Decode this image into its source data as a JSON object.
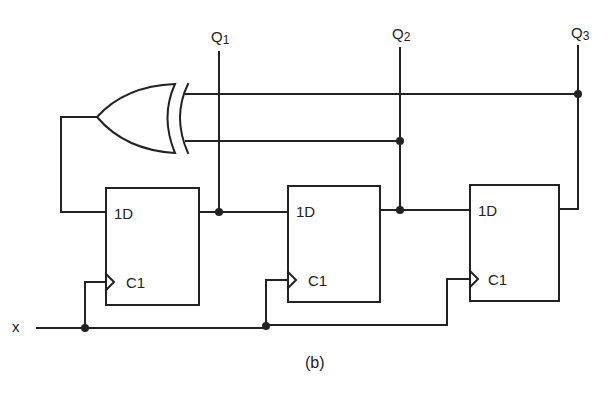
{
  "diagram": {
    "type": "shift-register-with-xor-feedback",
    "caption": "(b)",
    "input_label": "x",
    "outputs": [
      {
        "label_main": "Q",
        "label_sub": "1"
      },
      {
        "label_main": "Q",
        "label_sub": "2"
      },
      {
        "label_main": "Q",
        "label_sub": "3"
      }
    ],
    "flipflops": [
      {
        "d_label": "1D",
        "clk_label": "C1"
      },
      {
        "d_label": "1D",
        "clk_label": "C1"
      },
      {
        "d_label": "1D",
        "clk_label": "C1"
      }
    ],
    "gate": {
      "type": "XOR",
      "inputs": [
        "Q2",
        "Q3"
      ],
      "output": "FF1.1D"
    },
    "colors": {
      "line": "#222222",
      "background": "#ffffff"
    }
  }
}
